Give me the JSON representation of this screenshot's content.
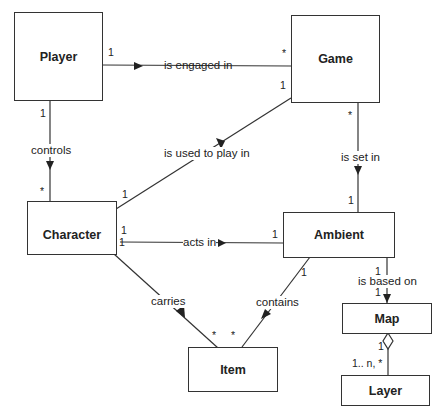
{
  "diagram": {
    "type": "UML class diagram",
    "classes": [
      {
        "id": "player",
        "name": "Player"
      },
      {
        "id": "game",
        "name": "Game"
      },
      {
        "id": "character",
        "name": "Character"
      },
      {
        "id": "ambient",
        "name": "Ambient"
      },
      {
        "id": "map",
        "name": "Map"
      },
      {
        "id": "item",
        "name": "Item"
      },
      {
        "id": "layer",
        "name": "Layer"
      }
    ],
    "associations": [
      {
        "id": "engaged",
        "from": "Player",
        "to": "Game",
        "label": "is engaged in",
        "from_mult": "1",
        "to_mult": "*"
      },
      {
        "id": "controls",
        "from": "Player",
        "to": "Character",
        "label": "controls",
        "from_mult": "1",
        "to_mult": "*"
      },
      {
        "id": "used",
        "from": "Character",
        "to": "Game",
        "label": "is used to play in",
        "from_mult": "1",
        "to_mult": "1"
      },
      {
        "id": "setin",
        "from": "Game",
        "to": "Ambient",
        "label": "is set in",
        "from_mult": "*",
        "to_mult": "1"
      },
      {
        "id": "acts",
        "from": "Character",
        "to": "Ambient",
        "label": "acts in",
        "from_mult": "1",
        "from_mult2": "1",
        "to_mult": "1"
      },
      {
        "id": "carries",
        "from": "Character",
        "to": "Item",
        "label": "carries",
        "to_mult": "*"
      },
      {
        "id": "contains",
        "from": "Ambient",
        "to": "Item",
        "label": "contains",
        "from_mult": "1",
        "to_mult": "*"
      },
      {
        "id": "based",
        "from": "Ambient",
        "to": "Map",
        "label": "is based on",
        "from_mult": "1",
        "to_mult": "1"
      },
      {
        "id": "aggregation",
        "from": "Map",
        "to": "Layer",
        "label": "",
        "from_mult": "1",
        "to_mult": "1.. n, *"
      }
    ]
  }
}
